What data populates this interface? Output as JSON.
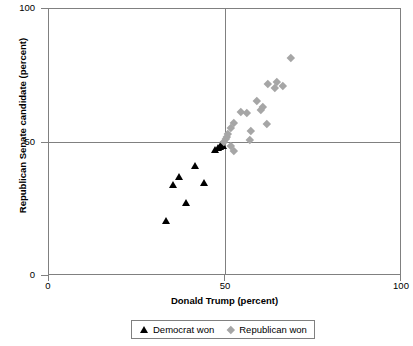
{
  "chart_data": {
    "type": "scatter",
    "title": "",
    "xlabel": "Donald Trump (percent)",
    "ylabel": "Republican Senate candidate (percent)",
    "xlim": [
      0,
      100
    ],
    "ylim": [
      0,
      100
    ],
    "xticks": [
      "0",
      "50",
      "100"
    ],
    "yticks": [
      "0",
      "50",
      "100"
    ],
    "grid": true,
    "gridlines": {
      "x": [
        50
      ],
      "y": [
        50
      ]
    },
    "legend_position": "bottom-center",
    "colors": {
      "democrat": "#000000",
      "republican": "#a6a6a6",
      "axis": "#808080"
    },
    "series": [
      {
        "name": "Democrat won",
        "marker": "triangle",
        "color": "#000000",
        "points": [
          [
            33.2,
            20.6
          ],
          [
            35.1,
            34.1
          ],
          [
            36.8,
            37.1
          ],
          [
            38.8,
            27.4
          ],
          [
            41.4,
            41.2
          ],
          [
            43.9,
            34.8
          ],
          [
            47.2,
            47.2
          ],
          [
            47.9,
            47.9
          ],
          [
            48.4,
            48.5
          ],
          [
            48.9,
            49.1
          ],
          [
            49.4,
            48.9
          ]
        ]
      },
      {
        "name": "Republican won",
        "marker": "diamond",
        "color": "#a6a6a6",
        "points": [
          [
            49.6,
            50.2
          ],
          [
            50.1,
            51.3
          ],
          [
            50.4,
            52.0
          ],
          [
            50.7,
            53.1
          ],
          [
            51.4,
            55.4
          ],
          [
            52.4,
            57.3
          ],
          [
            54.2,
            61.4
          ],
          [
            55.9,
            61.2
          ],
          [
            56.9,
            51.0
          ],
          [
            57.1,
            54.3
          ],
          [
            58.9,
            65.8
          ],
          [
            60.1,
            62.4
          ],
          [
            60.6,
            63.5
          ],
          [
            61.8,
            57.1
          ],
          [
            62.0,
            71.8
          ],
          [
            63.9,
            70.4
          ],
          [
            64.6,
            72.9
          ],
          [
            66.3,
            71.3
          ],
          [
            68.4,
            81.7
          ],
          [
            51.6,
            48.9
          ],
          [
            52.3,
            46.8
          ]
        ]
      }
    ]
  },
  "axes": {
    "y": {
      "title": "Republican Senate candidate (percent)",
      "ticks": [
        {
          "label": "100",
          "value": 100
        },
        {
          "label": "50",
          "value": 50
        },
        {
          "label": "0",
          "value": 0
        }
      ]
    },
    "x": {
      "title": "Donald Trump (percent)",
      "ticks": [
        {
          "label": "0",
          "value": 0
        },
        {
          "label": "50",
          "value": 50
        },
        {
          "label": "100",
          "value": 100
        }
      ]
    }
  },
  "legend": {
    "entries": [
      {
        "label": "Democrat won",
        "marker": "triangle-icon"
      },
      {
        "label": "Republican won",
        "marker": "diamond-icon"
      }
    ]
  }
}
